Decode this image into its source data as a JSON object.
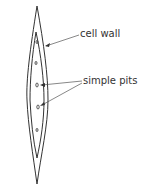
{
  "diagram": {
    "labels": {
      "cell_wall": "cell wall",
      "simple_pits": "simple pits"
    },
    "colors": {
      "line": "#333333",
      "background": "#ffffff"
    }
  }
}
